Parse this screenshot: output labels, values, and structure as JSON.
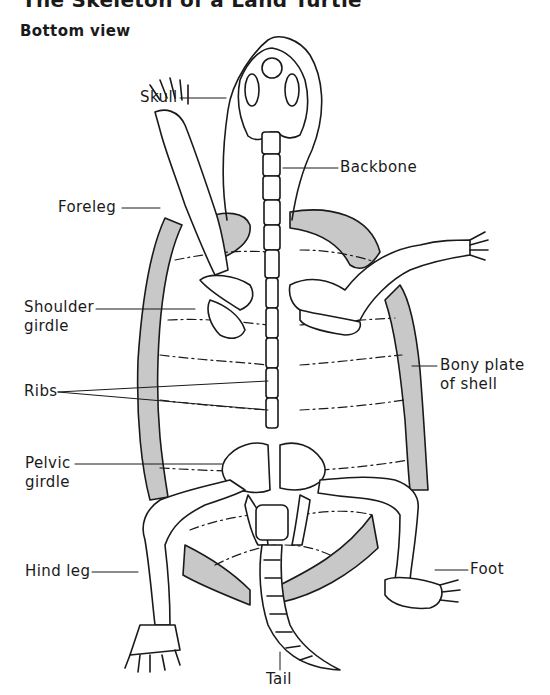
{
  "diagram": {
    "title": "The Skeleton of a Land Turtle",
    "subtitle": "Bottom view",
    "colors": {
      "ink": "#1a1a1a",
      "shell_fill": "#c8c8c8",
      "background": "#ffffff"
    },
    "labels": {
      "skull": "Skull",
      "backbone": "Backbone",
      "foreleg": "Foreleg",
      "shoulder_girdle": "Shoulder\ngirdle",
      "ribs": "Ribs",
      "bony_plate": "Bony plate\nof shell",
      "pelvic_girdle": "Pelvic\ngirdle",
      "hind_leg": "Hind leg",
      "foot": "Foot",
      "tail": "Tail"
    }
  }
}
